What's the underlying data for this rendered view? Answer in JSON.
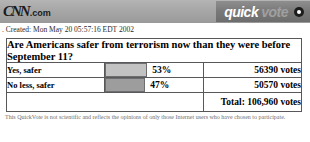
{
  "header": {
    "brand_mark": "CNN",
    "brand_suffix": ".com",
    "quickvote_first": "quick",
    "quickvote_second": "vote",
    "close_icon": "close-dot-icon"
  },
  "created": {
    "text": ". Created: Mon May 20 05:57:16 EDT 2002"
  },
  "poll": {
    "question": "Are Americans safer from terrorism now than they were before September 11?",
    "total_label": "Total: 106,960 votes",
    "rows": [
      {
        "label": "Yes, safer",
        "percent_label": "53%",
        "votes_label": "56390 votes",
        "bar_width_px": 40,
        "bar_color": "#c2c2c2"
      },
      {
        "label": "No less, safer",
        "percent_label": "47%",
        "votes_label": "50570 votes",
        "bar_width_px": 38,
        "bar_color": "#9d9d9d"
      }
    ]
  },
  "footer": {
    "disclaimer": "This QuickVote is not scientific and reflects the opinions of only those Internet users who have chosen to participate."
  },
  "chart_data": {
    "type": "bar",
    "title": "Are Americans safer from terrorism now than they were before September 11?",
    "categories": [
      "Yes, safer",
      "No less, safer"
    ],
    "values": [
      53,
      47
    ],
    "counts": [
      56390,
      50570
    ],
    "total": 106960,
    "xlabel": "",
    "ylabel": "Percent of votes",
    "ylim": [
      0,
      100
    ],
    "legend": "none",
    "grid": false
  }
}
